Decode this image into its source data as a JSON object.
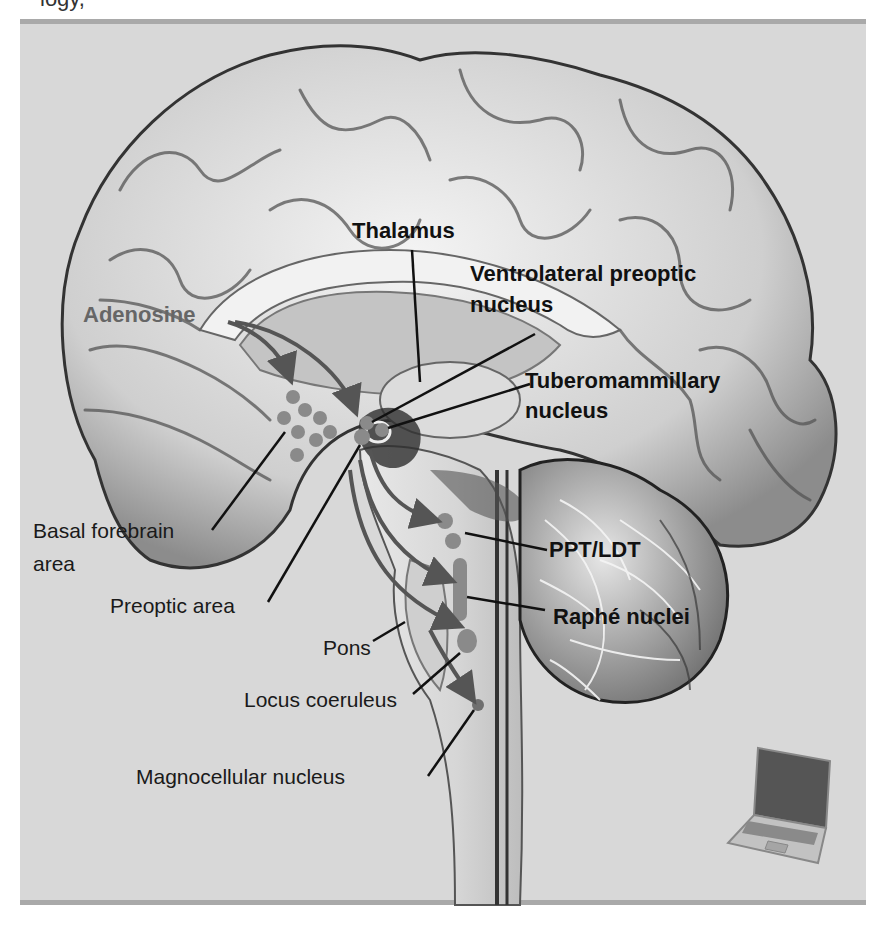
{
  "caption_fragment": "logy,",
  "figure": {
    "colors": {
      "frame_bg": "#d8d8d8",
      "frame_bar": "#a9a9a9",
      "nucleus_dot": "#8a8a8a",
      "arrow": "#555555",
      "label_bold": "#111111",
      "label_adenosine": "#666666"
    }
  },
  "labels": {
    "thalamus": "Thalamus",
    "vlpo_line1": "Ventrolateral preoptic",
    "vlpo_line2": "nucleus",
    "adenosine": "Adenosine",
    "tmn_line1": "Tuberomammillary",
    "tmn_line2": "nucleus",
    "basal_line1": "Basal forebrain",
    "basal_line2": "area",
    "preoptic": "Preoptic area",
    "ppt_ldt": "PPT/LDT",
    "raphe": "Raphé nuclei",
    "pons": "Pons",
    "locus": "Locus coeruleus",
    "magno": "Magnocellular nucleus"
  },
  "icons": {
    "laptop": "laptop-icon"
  }
}
